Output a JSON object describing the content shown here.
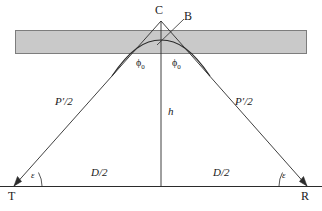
{
  "figure": {
    "type": "geometric-diagram",
    "canvas": {
      "width": 322,
      "height": 211
    },
    "colors": {
      "background": "#ffffff",
      "slab_fill": "#c9c9c9",
      "slab_stroke": "#7d7d7d",
      "line": "#2b2b2b",
      "text": "#1a1a1a"
    },
    "nodes": [
      {
        "id": "C",
        "label": "C",
        "x": 158,
        "y": 10,
        "role": "apex-vertex"
      },
      {
        "id": "B",
        "label": "B",
        "x": 186,
        "y": 16,
        "role": "curve-point"
      },
      {
        "id": "T",
        "label": "T",
        "x": 11,
        "y": 190,
        "role": "transmitter"
      },
      {
        "id": "R",
        "label": "R",
        "x": 303,
        "y": 190,
        "role": "receiver"
      }
    ],
    "measures": [
      {
        "id": "path-left",
        "label": "P′/2",
        "x": 59,
        "y": 96,
        "rotation": 0,
        "desc": "half ray path, left leg"
      },
      {
        "id": "path-right",
        "label": "P′/2",
        "x": 237,
        "y": 96,
        "rotation": 0,
        "desc": "half ray path, right leg"
      },
      {
        "id": "height",
        "label": "h",
        "x": 168,
        "y": 106,
        "rotation": 0,
        "desc": "virtual height"
      },
      {
        "id": "dist-left",
        "label": "D/2",
        "x": 91,
        "y": 168,
        "rotation": 0,
        "desc": "half ground distance, left"
      },
      {
        "id": "dist-right",
        "label": "D/2",
        "x": 216,
        "y": 168,
        "rotation": 0,
        "desc": "half ground distance, right"
      }
    ],
    "angles": [
      {
        "id": "phi-left",
        "label": "ϕ",
        "subscript": "0",
        "x": 135,
        "y": 58,
        "desc": "incidence angle at left"
      },
      {
        "id": "phi-right",
        "label": "ϕ",
        "subscript": "0",
        "x": 171,
        "y": 58,
        "desc": "incidence angle at right"
      },
      {
        "id": "eps-left",
        "label": "ε",
        "x": 32,
        "y": 172,
        "desc": "elevation angle at T"
      },
      {
        "id": "eps-right",
        "label": "ε",
        "x": 282,
        "y": 172,
        "desc": "elevation angle at R"
      }
    ],
    "slab": {
      "x": 15,
      "y": 30,
      "width": 292,
      "height": 24,
      "desc": "ionospheric layer slab"
    },
    "baseline": {
      "y": 186,
      "x1": 0,
      "x2": 322,
      "desc": "ground line from T to R"
    }
  }
}
